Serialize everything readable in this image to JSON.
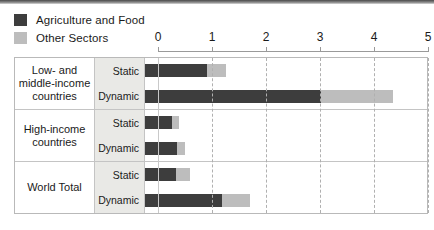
{
  "legend": {
    "items": [
      {
        "label": "Agriculture and Food",
        "color": "#3d3d3d",
        "icon": "legend-swatch"
      },
      {
        "label": "Other Sectors",
        "color": "#bdbdbd",
        "icon": "legend-swatch"
      }
    ]
  },
  "axis": {
    "ticks": [
      "0",
      "1",
      "2",
      "3",
      "4",
      "5"
    ],
    "min": 0,
    "max": 5
  },
  "rows": [
    {
      "group": "Low- and middle-income countries",
      "scenarios": [
        {
          "label": "Static",
          "agriculture": 1.15,
          "other": 0.35,
          "total": 1.5
        },
        {
          "label": "Dynamic",
          "agriculture": 3.25,
          "other": 1.35,
          "total": 4.6
        }
      ]
    },
    {
      "group": "High-income countries",
      "scenarios": [
        {
          "label": "Static",
          "agriculture": 0.5,
          "other": 0.13,
          "total": 0.63
        },
        {
          "label": "Dynamic",
          "agriculture": 0.6,
          "other": 0.15,
          "total": 0.75
        }
      ]
    },
    {
      "group": "World Total",
      "scenarios": [
        {
          "label": "Static",
          "agriculture": 0.57,
          "other": 0.26,
          "total": 0.83
        },
        {
          "label": "Dynamic",
          "agriculture": 1.43,
          "other": 0.52,
          "total": 1.95
        }
      ]
    }
  ],
  "chart_data": {
    "type": "bar",
    "orientation": "horizontal",
    "stacked": true,
    "title": "",
    "xlabel": "",
    "ylabel": "",
    "xlim": [
      0,
      5
    ],
    "xticks": [
      0,
      1,
      2,
      3,
      4,
      5
    ],
    "grid": true,
    "legend_position": "top-left",
    "categories": [
      "Low- and middle-income countries / Static",
      "Low- and middle-income countries / Dynamic",
      "High-income countries / Static",
      "High-income countries / Dynamic",
      "World Total / Static",
      "World Total / Dynamic"
    ],
    "series": [
      {
        "name": "Agriculture and Food",
        "color": "#3d3d3d",
        "values": [
          1.15,
          3.25,
          0.5,
          0.6,
          0.57,
          1.43
        ]
      },
      {
        "name": "Other Sectors",
        "color": "#bdbdbd",
        "values": [
          0.35,
          1.35,
          0.13,
          0.15,
          0.26,
          0.52
        ]
      }
    ],
    "totals": [
      1.5,
      4.6,
      0.63,
      0.75,
      0.83,
      1.95
    ]
  }
}
